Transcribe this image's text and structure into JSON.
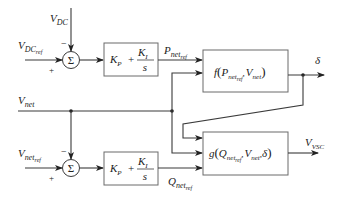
{
  "diagram": {
    "type": "control-block-diagram",
    "inputs": {
      "vdc": {
        "main": "V",
        "sub": "DC"
      },
      "vdc_ref": {
        "main": "V",
        "sub": "DC",
        "subsub": "ref"
      },
      "vnet": {
        "main": "V",
        "sub": "net"
      },
      "vnet_ref": {
        "main": "V",
        "sub": "net",
        "subsub": "ref"
      }
    },
    "summers": {
      "top": {
        "symbol": "Σ",
        "minus": "−",
        "plus": "+"
      },
      "bottom": {
        "symbol": "Σ",
        "minus": "−",
        "plus": "+"
      }
    },
    "pi_blocks": {
      "top": {
        "kp": "K",
        "kp_sub": "P",
        "plus": "+",
        "ki": "K",
        "ki_sub": "I",
        "den": "s"
      },
      "bottom": {
        "kp": "K",
        "kp_sub": "P",
        "plus": "+",
        "ki": "K",
        "ki_sub": "I",
        "den": "s"
      }
    },
    "signals": {
      "p_ref": {
        "main": "P",
        "sub": "net",
        "subsub": "ref"
      },
      "q_ref": {
        "main": "Q",
        "sub": "net",
        "subsub": "ref"
      }
    },
    "f_block": {
      "fn": "f",
      "open": "(",
      "a": "P",
      "a_sub": "net",
      "a_subsub": "ref",
      "sep": ",",
      "b": "V",
      "b_sub": "net",
      "close": ")"
    },
    "g_block": {
      "fn": "g",
      "open": "(",
      "a": "Q",
      "a_sub": "net",
      "a_subsub": "ref",
      "sep1": ",",
      "b": "V",
      "b_sub": "net",
      "sep2": ",",
      "c": "δ",
      "close": ")"
    },
    "outputs": {
      "delta": {
        "main": "δ"
      },
      "vvsc": {
        "main": "V",
        "sub": "VSC"
      }
    }
  }
}
